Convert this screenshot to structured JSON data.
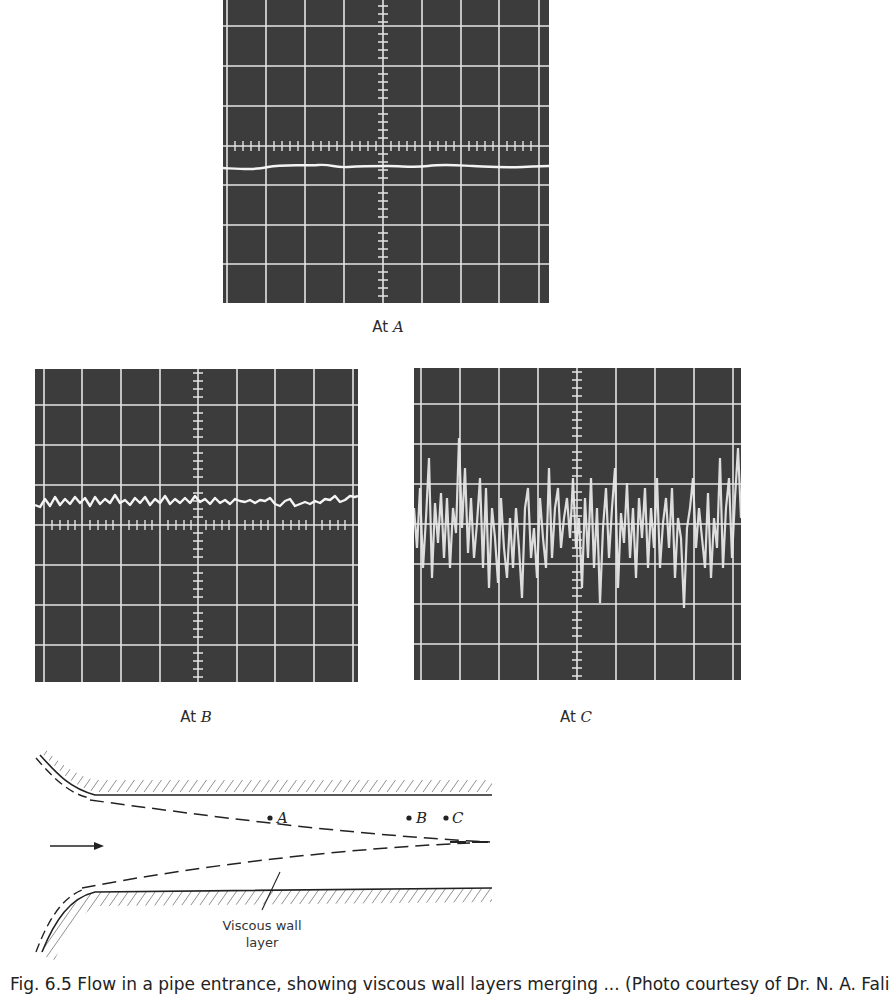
{
  "figure": {
    "panels": [
      {
        "id": "A",
        "label_prefix": "At",
        "label_var": "A",
        "signal": "steady laminar trace (nearly flat line)",
        "trace_level_divisions": 0.5
      },
      {
        "id": "B",
        "label_prefix": "At",
        "label_var": "B",
        "signal": "small periodic wavy oscillations (transitional)",
        "trace_level_divisions": 0.5
      },
      {
        "id": "C",
        "label_prefix": "At",
        "label_var": "C",
        "signal": "large random fluctuations (turbulent)",
        "trace_level_divisions": 0.0
      }
    ],
    "oscilloscope": {
      "grid_divisions_x": 8,
      "grid_divisions_y": 8,
      "background_color": "#3c3c3c",
      "grid_color": "#e6e6e6",
      "trace_color": "#f2f2f2"
    },
    "diagram": {
      "points": [
        {
          "label": "A",
          "description": "inside core flow, upstream"
        },
        {
          "label": "B",
          "description": "near merging point of boundary layers"
        },
        {
          "label": "C",
          "description": "downstream after boundary layers merge"
        }
      ],
      "annotation": "Viscous wall layer",
      "annotation_line1": "Viscous wall",
      "annotation_line2": "layer",
      "flow_direction": "left-to-right arrow"
    },
    "caption_visible": "(Photo courtesy of Dr. N. A. Fali"
  },
  "labels": {
    "at": "At",
    "A": "A",
    "B": "B",
    "C": "C",
    "viscous_wall": "Viscous wall",
    "layer": "layer",
    "caption": "Fig. 6.5  Flow in a pipe entrance, showing viscous wall layers merging ... (Photo courtesy of Dr. N. A. Fali"
  }
}
